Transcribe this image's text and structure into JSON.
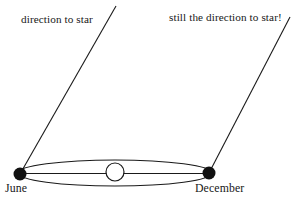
{
  "figure": {
    "background_color": "#ffffff",
    "ink_color": "#1a1a1a"
  },
  "labels": {
    "sight_line_left": "direction to star",
    "sight_line_right": "still the direction to star!",
    "position_left": "June",
    "position_right": "December"
  },
  "elements": {
    "orbit": {
      "name": "earth-orbit-ellipse",
      "center_x": 115,
      "center_y": 173,
      "radius_x": 97,
      "radius_y": 13,
      "stroke": "#1a1a1a",
      "fill": "none"
    },
    "sun": {
      "name": "sun",
      "center_x": 115,
      "center_y": 172,
      "radius": 9,
      "stroke": "#1a1a1a",
      "fill": "#ffffff"
    },
    "major_axis": {
      "name": "orbit-major-axis",
      "x1": 20,
      "y1": 173,
      "x2": 210,
      "y2": 173,
      "stroke": "#1a1a1a"
    },
    "earth_june": {
      "name": "earth-june-position",
      "center_x": 20,
      "center_y": 174,
      "radius": 6.5,
      "fill": "#111111"
    },
    "earth_december": {
      "name": "earth-december-position",
      "center_x": 209,
      "center_y": 173,
      "radius": 6.5,
      "fill": "#111111"
    },
    "sight_line_june": {
      "name": "sight-line-from-june",
      "x1": 20,
      "y1": 174,
      "x2": 116,
      "y2": 6,
      "stroke": "#1a1a1a"
    },
    "sight_line_december": {
      "name": "sight-line-from-december",
      "x1": 209,
      "y1": 173,
      "x2": 290,
      "y2": 17,
      "stroke": "#1a1a1a"
    }
  }
}
